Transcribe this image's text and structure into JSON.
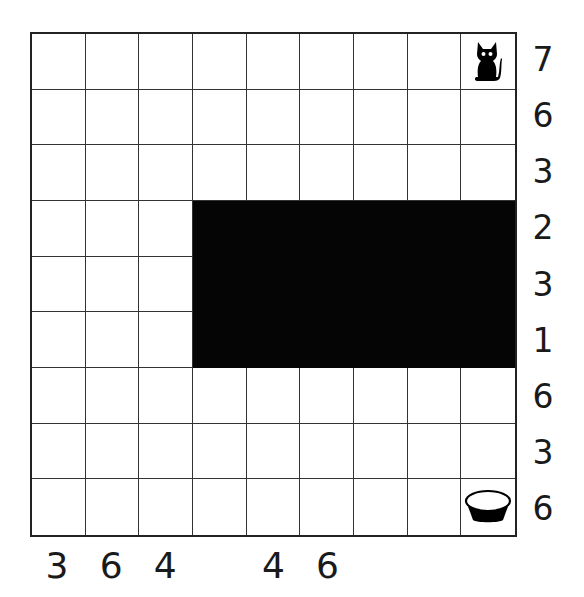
{
  "puzzle": {
    "rows": 9,
    "cols": 9,
    "filled_region": {
      "row_start": 3,
      "row_end": 5,
      "col_start": 3,
      "col_end": 8
    },
    "start": {
      "row": 0,
      "col": 8,
      "icon": "cat-icon"
    },
    "goal": {
      "row": 8,
      "col": 8,
      "icon": "bowl-icon"
    },
    "row_clues": [
      "7",
      "6",
      "3",
      "2",
      "3",
      "1",
      "6",
      "3",
      "6"
    ],
    "col_clues": [
      "3",
      "6",
      "4",
      "",
      "4",
      "6",
      "",
      "",
      ""
    ]
  },
  "colors": {
    "grid_line": "#333333",
    "filled": "#050505",
    "background": "#ffffff",
    "text": "#1a1a1a"
  }
}
